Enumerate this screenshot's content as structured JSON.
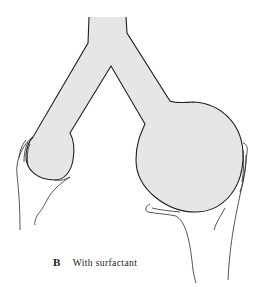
{
  "figure": {
    "panel_label": "B",
    "caption": "With surfactant",
    "parts": {
      "airway": "branching-tube",
      "left_alveolus": "small-bubble",
      "right_alveolus": "large-bubble",
      "left_hand": "hand-holding-small-bubble",
      "right_hand": "hand-holding-large-bubble"
    },
    "colors": {
      "fill": "#e6e6e6",
      "outline": "#1f1f1f",
      "background": "#ffffff"
    }
  }
}
